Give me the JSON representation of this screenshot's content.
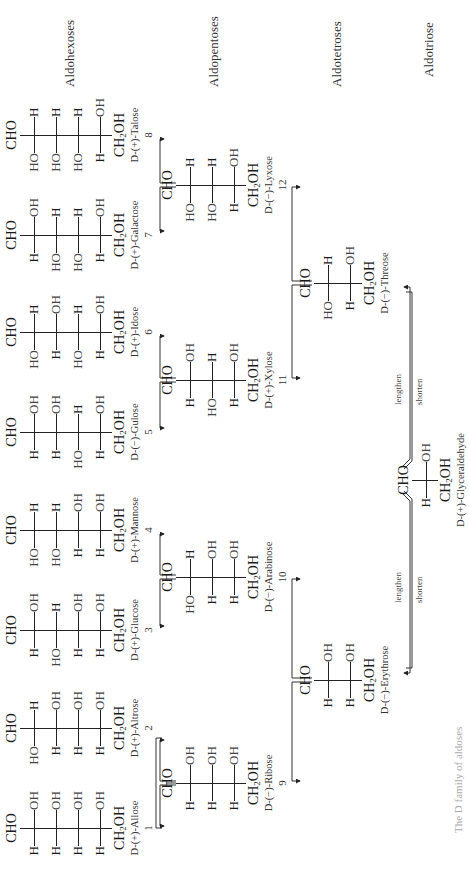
{
  "headers": {
    "hexoses": "Aldohexoses",
    "pentoses": "Aldopentoses",
    "tetroses": "Aldotetroses",
    "triose": "Aldotriose"
  },
  "labels": {
    "cho": "CHO",
    "ch2oh_prefix": "CH",
    "ch2oh_sub": "2",
    "ch2oh_suffix": "OH",
    "lengthen": "lengthen",
    "shorten": "shorten"
  },
  "caption": "The D family of aldoses",
  "molecules": {
    "allose": {
      "name": "D-(+)-Allose",
      "number": "1",
      "rows": [
        [
          "H",
          "OH"
        ],
        [
          "H",
          "OH"
        ],
        [
          "H",
          "OH"
        ],
        [
          "H",
          "OH"
        ]
      ]
    },
    "altrose": {
      "name": "D-(+)-Altrose",
      "number": "2",
      "rows": [
        [
          "HO",
          "H"
        ],
        [
          "H",
          "OH"
        ],
        [
          "H",
          "OH"
        ],
        [
          "H",
          "OH"
        ]
      ]
    },
    "glucose": {
      "name": "D-(+)-Glucose",
      "number": "3",
      "rows": [
        [
          "H",
          "OH"
        ],
        [
          "HO",
          "H"
        ],
        [
          "H",
          "OH"
        ],
        [
          "H",
          "OH"
        ]
      ]
    },
    "mannose": {
      "name": "D-(+)-Mannose",
      "number": "4",
      "rows": [
        [
          "HO",
          "H"
        ],
        [
          "HO",
          "H"
        ],
        [
          "H",
          "OH"
        ],
        [
          "H",
          "OH"
        ]
      ]
    },
    "gulose": {
      "name": "D-(−)-Gulose",
      "number": "5",
      "rows": [
        [
          "H",
          "OH"
        ],
        [
          "H",
          "OH"
        ],
        [
          "HO",
          "H"
        ],
        [
          "H",
          "OH"
        ]
      ]
    },
    "idose": {
      "name": "D-(+)-Idose",
      "number": "6",
      "rows": [
        [
          "HO",
          "H"
        ],
        [
          "H",
          "OH"
        ],
        [
          "HO",
          "H"
        ],
        [
          "H",
          "OH"
        ]
      ]
    },
    "galactose": {
      "name": "D-(+)-Galactose",
      "number": "7",
      "rows": [
        [
          "H",
          "OH"
        ],
        [
          "HO",
          "H"
        ],
        [
          "HO",
          "H"
        ],
        [
          "H",
          "OH"
        ]
      ]
    },
    "talose": {
      "name": "D-(+)-Talose",
      "number": "8",
      "rows": [
        [
          "HO",
          "H"
        ],
        [
          "HO",
          "H"
        ],
        [
          "HO",
          "H"
        ],
        [
          "H",
          "OH"
        ]
      ]
    },
    "ribose": {
      "name": "D-(−)-Ribose",
      "number": "9",
      "rows": [
        [
          "H",
          "OH"
        ],
        [
          "H",
          "OH"
        ],
        [
          "H",
          "OH"
        ]
      ]
    },
    "arabinose": {
      "name": "D-(−)-Arabinose",
      "number": "10",
      "rows": [
        [
          "HO",
          "H"
        ],
        [
          "H",
          "OH"
        ],
        [
          "H",
          "OH"
        ]
      ]
    },
    "xylose": {
      "name": "D-(+)-Xylose",
      "number": "11",
      "rows": [
        [
          "H",
          "OH"
        ],
        [
          "HO",
          "H"
        ],
        [
          "H",
          "OH"
        ]
      ]
    },
    "lyxose": {
      "name": "D-(−)-Lyxose",
      "number": "12",
      "rows": [
        [
          "HO",
          "H"
        ],
        [
          "HO",
          "H"
        ],
        [
          "H",
          "OH"
        ]
      ]
    },
    "erythrose": {
      "name": "D-(−)-Erythrose",
      "number": "",
      "rows": [
        [
          "H",
          "OH"
        ],
        [
          "H",
          "OH"
        ]
      ]
    },
    "threose": {
      "name": "D-(−)-Threose",
      "number": "",
      "rows": [
        [
          "HO",
          "H"
        ],
        [
          "H",
          "OH"
        ]
      ]
    },
    "glyceraldehyde": {
      "name": "D-(+)-Glyceraldehyde",
      "number": "",
      "rows": [
        [
          "H",
          "OH"
        ]
      ]
    }
  }
}
